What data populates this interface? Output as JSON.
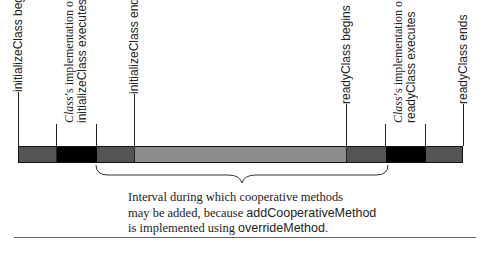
{
  "labels": {
    "init_begins": "initializeClass begins",
    "class_impl_init_1_italic": "Class",
    "class_impl_init_1_rest": "’s implementation of",
    "class_impl_init_2": "initializeClass executes",
    "init_ends": "initializeClass ends",
    "ready_begins": "readyClass begins",
    "class_impl_ready_1_italic": "Class",
    "class_impl_ready_1_rest": "’s implementation of",
    "class_impl_ready_2": "readyClass executes",
    "ready_ends": "readyClass ends"
  },
  "note": {
    "line1": "Interval during which cooperative methods",
    "line2_pre": "may be added, because ",
    "line2_code": "addCooperativeMethod",
    "line3_pre": "is implemented using ",
    "line3_code": "overrideMethod",
    "line3_post": "."
  },
  "bar_segments": [
    {
      "name": "initialize-phase-start",
      "width": 38,
      "color": "#555555"
    },
    {
      "name": "class-initialize-impl",
      "width": 40,
      "color": "#000000"
    },
    {
      "name": "initialize-phase-end",
      "width": 38,
      "color": "#555555"
    },
    {
      "name": "cooperative-interval",
      "width": 212,
      "color": "#8c8c8c"
    },
    {
      "name": "ready-phase-start",
      "width": 39,
      "color": "#555555"
    },
    {
      "name": "class-ready-impl",
      "width": 40,
      "color": "#000000"
    },
    {
      "name": "ready-phase-end",
      "width": 38,
      "color": "#555555"
    }
  ]
}
